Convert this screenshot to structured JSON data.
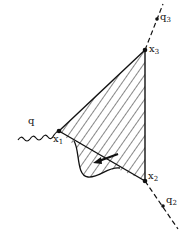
{
  "diagram": {
    "type": "feynman-style triangle diagram with hatched region",
    "colors": {
      "ink": "#111111",
      "background": "#ffffff"
    },
    "vertices": {
      "x1": {
        "label": "x",
        "sub": "1"
      },
      "x2": {
        "label": "x",
        "sub": "2"
      },
      "x3": {
        "label": "x",
        "sub": "3"
      }
    },
    "external_lines": {
      "q": {
        "label": "q",
        "sub": "",
        "style": "wavy"
      },
      "q2": {
        "label": "q",
        "sub": "2",
        "style": "dashed"
      },
      "q3": {
        "label": "q",
        "sub": "3",
        "style": "dashed"
      }
    },
    "region": {
      "fill": "diagonal-hatch",
      "arrow": "left-pointing arrow inside bulge"
    }
  }
}
